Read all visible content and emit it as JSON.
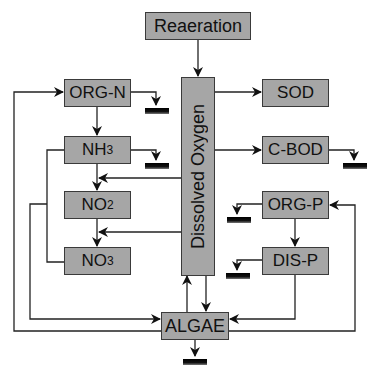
{
  "diagram": {
    "box_fill": "#a6a6a6",
    "nodes": {
      "reaeration": {
        "label": "Reaeration"
      },
      "dissolved_oxygen": {
        "label": "Dissolved Oxygen"
      },
      "org_n": {
        "label": "ORG-N"
      },
      "nh3": {
        "label": "NH",
        "sub": "3"
      },
      "no2": {
        "label": "NO",
        "sub": "2"
      },
      "no3": {
        "label": "NO",
        "sub": "3"
      },
      "sod": {
        "label": "SOD"
      },
      "c_bod": {
        "label": "C-BOD"
      },
      "org_p": {
        "label": "ORG-P"
      },
      "dis_p": {
        "label": "DIS-P"
      },
      "algae": {
        "label": "ALGAE"
      }
    },
    "edges": [
      {
        "from": "Reaeration",
        "to": "Dissolved Oxygen"
      },
      {
        "from": "Dissolved Oxygen",
        "to": "SOD"
      },
      {
        "from": "Dissolved Oxygen",
        "to": "C-BOD"
      },
      {
        "from": "Dissolved Oxygen",
        "to": "NH3->NO2"
      },
      {
        "from": "Dissolved Oxygen",
        "to": "NO2->NO3"
      },
      {
        "from": "Dissolved Oxygen",
        "to": "ALGAE"
      },
      {
        "from": "ALGAE",
        "to": "Dissolved Oxygen"
      },
      {
        "from": "ORG-N",
        "to": "NH3"
      },
      {
        "from": "NH3",
        "to": "NO2"
      },
      {
        "from": "NO2",
        "to": "NO3"
      },
      {
        "from": "NH3",
        "to": "ALGAE"
      },
      {
        "from": "NO3",
        "to": "ALGAE"
      },
      {
        "from": "ALGAE",
        "to": "ORG-N"
      },
      {
        "from": "ORG-P",
        "to": "DIS-P"
      },
      {
        "from": "DIS-P",
        "to": "ALGAE"
      },
      {
        "from": "ALGAE",
        "to": "ORG-P"
      }
    ],
    "settling_sinks": [
      "ORG-N",
      "NH3",
      "C-BOD",
      "ORG-P",
      "DIS-P",
      "ALGAE"
    ]
  }
}
